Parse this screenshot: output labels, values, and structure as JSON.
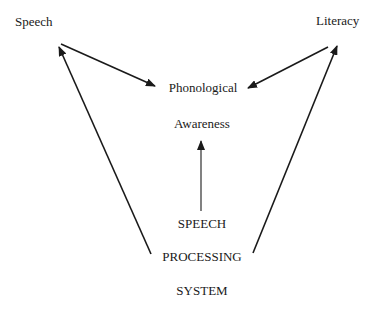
{
  "diagram": {
    "nodes": {
      "speech": {
        "label": "Speech"
      },
      "literacy": {
        "label": "Literacy"
      },
      "phonological_awareness": {
        "line1": "Phonological",
        "line2": "Awareness"
      },
      "speech_processing_system": {
        "line1": "SPEECH",
        "line2": "PROCESSING",
        "line3": "SYSTEM"
      }
    },
    "edges": [
      {
        "from": "Speech",
        "to": "Phonological Awareness"
      },
      {
        "from": "Literacy",
        "to": "Phonological Awareness"
      },
      {
        "from": "Speech Processing System",
        "to": "Speech"
      },
      {
        "from": "Speech Processing System",
        "to": "Literacy"
      },
      {
        "from": "Speech Processing System",
        "to": "Phonological Awareness"
      }
    ],
    "colors": {
      "ink": "#1a1a1a",
      "background": "#ffffff"
    }
  }
}
